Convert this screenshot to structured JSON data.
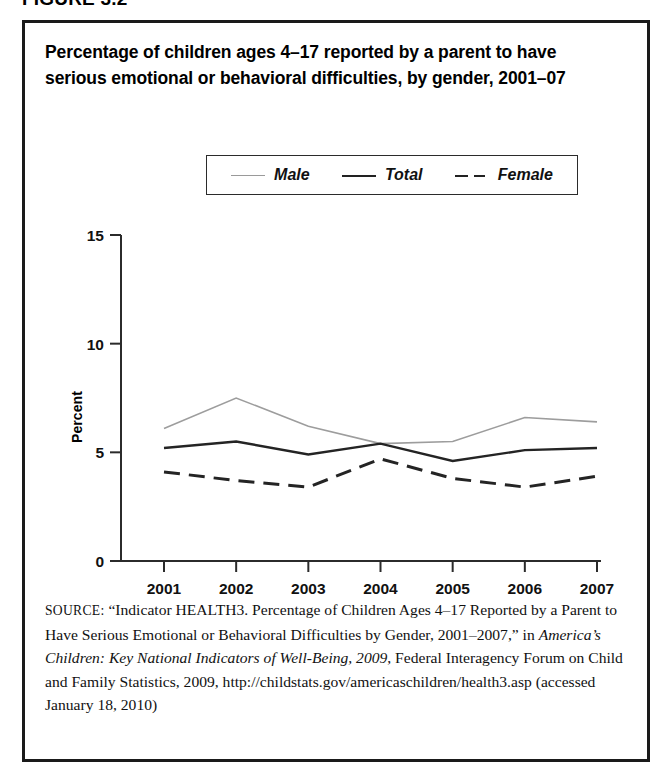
{
  "figure": {
    "number_label": "FIGURE 3.2",
    "title": "Percentage of children ages 4–17 reported by a parent to have serious emotional or behavioral difficulties, by gender, 2001–07"
  },
  "legend": {
    "items": [
      {
        "label": "Male",
        "style": "thin-gray-solid",
        "color": "#9d9d9d"
      },
      {
        "label": "Total",
        "style": "black-solid",
        "color": "#242424"
      },
      {
        "label": "Female",
        "style": "black-dashed",
        "color": "#242424"
      }
    ]
  },
  "axes": {
    "y_title": "Percent",
    "y_ticks": [
      "0",
      "5",
      "10",
      "15"
    ],
    "x_ticks": [
      "2001",
      "2002",
      "2003",
      "2004",
      "2005",
      "2006",
      "2007"
    ]
  },
  "chart_data": {
    "type": "line",
    "title": "Percentage of children ages 4–17 reported by a parent to have serious emotional or behavioral difficulties, by gender, 2001–07",
    "xlabel": "",
    "ylabel": "Percent",
    "categories": [
      "2001",
      "2002",
      "2003",
      "2004",
      "2005",
      "2006",
      "2007"
    ],
    "x": [
      2001,
      2002,
      2003,
      2004,
      2005,
      2006,
      2007
    ],
    "series": [
      {
        "name": "Male",
        "values": [
          6.1,
          7.5,
          6.2,
          5.4,
          5.5,
          6.6,
          6.4
        ],
        "color": "#9d9d9d",
        "dash": "solid",
        "width": 1.6
      },
      {
        "name": "Total",
        "values": [
          5.2,
          5.5,
          4.9,
          5.4,
          4.6,
          5.1,
          5.2
        ],
        "color": "#242424",
        "dash": "solid",
        "width": 2.4
      },
      {
        "name": "Female",
        "values": [
          4.1,
          3.7,
          3.4,
          4.7,
          3.8,
          3.4,
          3.9
        ],
        "color": "#242424",
        "dash": "dashed",
        "width": 3.0
      }
    ],
    "ylim": [
      0,
      15
    ],
    "yticks": [
      0,
      5,
      10,
      15
    ],
    "grid": false,
    "legend_position": "top-center"
  },
  "source": {
    "label": "SOURCE:",
    "text_part1": " “Indicator HEALTH3. Percentage of Children Ages 4–17 Reported by a Parent to Have Serious Emotional or Behavioral Difficulties by Gender, 2001–2007,” in ",
    "italic1": "America’s Children: Key National Indicators of Well-Being, 2009",
    "text_part2": ", Federal Interagency Forum on Child and Family Statistics, 2009, http://childstats.gov/americaschildren/health3.asp (accessed January 18, 2010)"
  }
}
